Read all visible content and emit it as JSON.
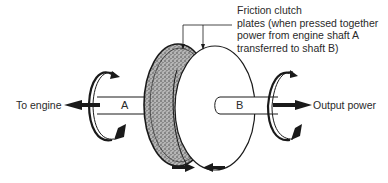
{
  "diagram": {
    "title": "Friction clutch",
    "callout": {
      "lines": [
        "Friction clutch",
        "plates (when pressed together",
        "power from engine shaft A",
        "transferred to shaft B)"
      ]
    },
    "labels": {
      "left": "To engine",
      "right": "Output power",
      "shaft_a": "A",
      "shaft_b": "B"
    },
    "colors": {
      "stroke": "#1a1a1a",
      "plate_fill": "#9a9a9a",
      "background": "#ffffff"
    }
  }
}
